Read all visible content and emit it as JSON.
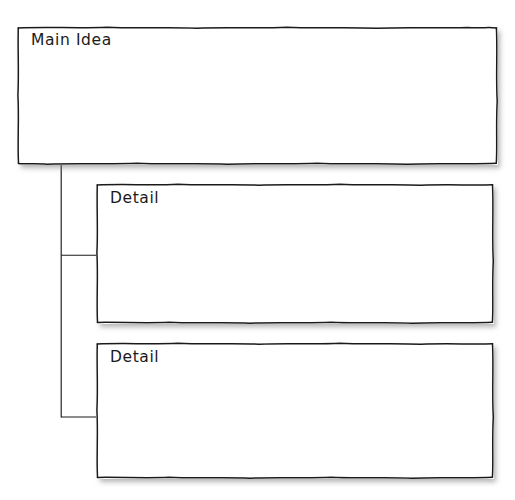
{
  "document": {
    "title": "Main Idea and Details Graphic Organizer",
    "background_color": "#ffffff",
    "ink_color": "#1a1a1a",
    "style": "photocopied hand-drawn worksheet with sketchy box outlines and drop shadows"
  },
  "organizer": {
    "type": "main-idea-and-details",
    "main_idea": {
      "label": "Main Idea",
      "value": "",
      "box": {
        "x": 17,
        "y": 26,
        "width": 481,
        "height": 139
      }
    },
    "details": [
      {
        "label": "Detail",
        "value": "",
        "box": {
          "x": 96,
          "y": 183,
          "width": 398,
          "height": 141
        }
      },
      {
        "label": "Detail",
        "value": "",
        "box": {
          "x": 96,
          "y": 342,
          "width": 398,
          "height": 137
        }
      }
    ],
    "connectors": {
      "trunk_x": 61,
      "trunk_top_y": 165,
      "trunk_bottom_y": 417,
      "branch_y_values": [
        255,
        417
      ],
      "branch_end_x": 97,
      "stroke_color": "#1a1a1a",
      "stroke_width": 1.1
    }
  }
}
